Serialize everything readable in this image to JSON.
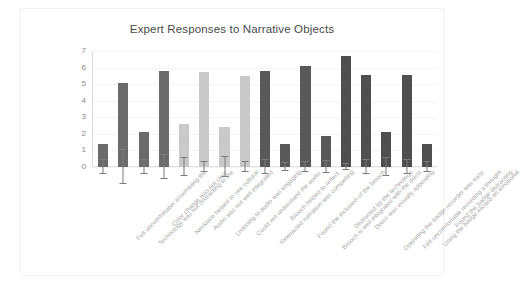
{
  "chart_data": {
    "type": "bar",
    "title": "Expert Responses to Narrative Objects",
    "xlabel": "",
    "ylabel": "",
    "ylim": [
      0,
      7
    ],
    "yticks": [
      0,
      1,
      2,
      3,
      4,
      5,
      6,
      7
    ],
    "grid": true,
    "legend": "none",
    "categories": [
      "Felt uncomfortable assembling the",
      "Technology was not distracting to the",
      "Color change was not clear",
      "Necklace helped to see cultural",
      "Audio was not well integrated",
      "Listening to audio was engaging",
      "Could not understand the audio.",
      "Reenacted narration was compelling",
      "Brooch helped to reflect.",
      "Found the inclusion of the brooch",
      "Brooch is well integrated with the dress",
      "Distracted by the technology",
      "Dress was visually appealing",
      "Operating the badge recorder was easy",
      "Felt uncomfortable recording a thought",
      "Using the badge elicited an emotional",
      "Found the badge distracting"
    ],
    "values": [
      1.4,
      5.1,
      2.1,
      5.8,
      2.6,
      5.75,
      2.4,
      5.5,
      5.8,
      1.4,
      6.1,
      1.85,
      6.7,
      5.55,
      2.1,
      5.55,
      1.4
    ],
    "errors": [
      0.45,
      1.0,
      0.45,
      0.75,
      0.55,
      0.3,
      0.6,
      0.3,
      0.4,
      0.25,
      0.3,
      0.35,
      0.2,
      0.45,
      0.55,
      0.45,
      0.3
    ],
    "bar_colors": [
      "#6b6b6b",
      "#6b6b6b",
      "#6b6b6b",
      "#6b6b6b",
      "#c9c9c9",
      "#c9c9c9",
      "#c9c9c9",
      "#c9c9c9",
      "#595959",
      "#595959",
      "#595959",
      "#595959",
      "#4f4f4f",
      "#4f4f4f",
      "#4f4f4f",
      "#4f4f4f",
      "#4f4f4f"
    ],
    "colors": {
      "group_a": "#6b6b6b",
      "group_b": "#c9c9c9",
      "group_c": "#595959",
      "group_d": "#4f4f4f",
      "error_bar": "#7b7b7b",
      "gridline": "#f4f4f4",
      "axis": "#d9d9d9",
      "tick_label": "#8a8a8a",
      "x_label": "#a8a8a8",
      "title": "#4a4a4a",
      "background": "#ffffff",
      "frame_border": "#f2f2f2"
    }
  }
}
